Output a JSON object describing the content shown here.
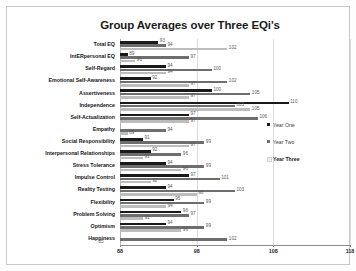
{
  "chart_data": {
    "type": "bar",
    "orientation": "horizontal",
    "title": "Group Averages over Three EQi's",
    "xlabel": "",
    "ylabel": "",
    "xlim": [
      88,
      118
    ],
    "xticks": [
      88,
      98,
      108,
      118
    ],
    "grid": true,
    "legend_position": "right",
    "categories": [
      "Total EQ",
      "IntERpersonal EQ",
      "Self-Regard",
      "Emotional Self-Awareness",
      "Assertiveness",
      "Independence",
      "Self-Actualization",
      "Empathy",
      "Social Responsibility",
      "Interpersonal Relationships",
      "Stress Tolerance",
      "Impulse Control",
      "Reality Testing",
      "Flexibility",
      "Problem Solving",
      "Optimism",
      "Happiness"
    ],
    "series": [
      {
        "name": "Year One",
        "color": "#1a1a1a",
        "values": [
          93,
          89,
          94,
          92,
          100,
          110,
          97,
          null,
          91,
          92,
          94,
          97,
          94,
          95,
          96,
          94,
          null
        ]
      },
      {
        "name": "Year Two",
        "color": "#6e6e6e",
        "values": [
          94,
          97,
          100,
          102,
          105,
          103,
          106,
          94,
          99,
          96,
          99,
          101,
          103,
          99,
          97,
          99,
          102
        ]
      },
      {
        "name": "Year Three",
        "color": "#bdbdbd",
        "values": [
          102,
          90,
          94,
          97,
          97,
          105,
          97,
          89,
          97,
          91,
          96,
          92,
          98,
          94,
          91,
          96,
          85
        ]
      }
    ]
  },
  "legend": {
    "items": [
      {
        "label": "Year One"
      },
      {
        "label": "Year Two"
      },
      {
        "label": "Year Three"
      }
    ]
  }
}
